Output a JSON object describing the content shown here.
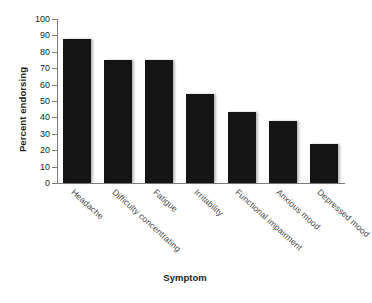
{
  "chart_data": {
    "type": "bar",
    "title": "",
    "xlabel": "Symptom",
    "ylabel": "Percent endorsing",
    "categories": [
      "Headache",
      "Difficulty concentrating",
      "Fatigue",
      "Irritability",
      "Functional impairment",
      "Anxious mood",
      "Depressed mood"
    ],
    "values": [
      88,
      75,
      75,
      54,
      43,
      38,
      24
    ],
    "ylim": [
      0,
      100
    ],
    "yticks": [
      0,
      10,
      20,
      30,
      40,
      50,
      60,
      70,
      80,
      90,
      100
    ],
    "ytick_labels": [
      "0",
      "10",
      "20",
      "30",
      "40",
      "50",
      "60",
      "70",
      "80",
      "90",
      "100"
    ],
    "grid": false,
    "legend": false,
    "bar_color": "#141414",
    "axis_color": "#7d7d7d",
    "background": "#ffffff"
  }
}
